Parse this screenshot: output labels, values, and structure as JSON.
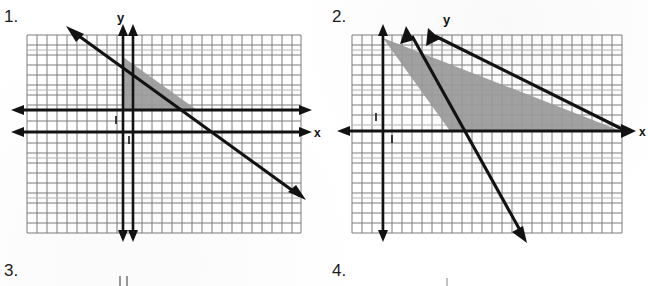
{
  "page": {
    "width": 648,
    "height": 286,
    "background": "#ffffff",
    "ink_color": "#1b1b1b",
    "grid_line_color": "#6f6f6f",
    "grid_line_color_light": "#a9a9a9",
    "shade_color": "#9a9a9a",
    "axis_color": "#111111"
  },
  "problems": [
    {
      "number": "1.",
      "label_x": 4,
      "label_y": 8,
      "graph": {
        "origin_x": 27,
        "origin_y": 35,
        "width": 274,
        "height": 198,
        "cell": 10,
        "cols": 27,
        "rows": 20,
        "axis_labels": {
          "x": "x",
          "y": "y"
        },
        "tick_marks": [
          "1",
          "1"
        ],
        "x_axis_row": 9.7,
        "y_axis_col": 9.5,
        "lines": [
          {
            "name": "boundary-line",
            "x1": 70,
            "y1": 28,
            "x2": 302,
            "y2": 198,
            "arrow_start": true,
            "arrow_end": true
          }
        ],
        "shaded_region": {
          "name": "solution-region",
          "points": "122,56 122,110 196,110"
        }
      }
    },
    {
      "number": "2.",
      "label_x": 332,
      "label_y": 8,
      "graph": {
        "origin_x": 352,
        "origin_y": 35,
        "width": 274,
        "height": 198,
        "cell": 10,
        "cols": 27,
        "rows": 20,
        "axis_labels": {
          "x": "x",
          "y": "y"
        },
        "tick_marks": [
          "1",
          "1"
        ],
        "x_axis_row": 9.7,
        "y_axis_col": 3.0,
        "lines": [
          {
            "name": "steep-boundary-line",
            "x1": 408,
            "y1": 31,
            "x2": 524,
            "y2": 238,
            "arrow_start": true,
            "arrow_end": true
          },
          {
            "name": "shallow-boundary-line",
            "x1": 429,
            "y1": 31,
            "x2": 627,
            "y2": 133,
            "arrow_start": true,
            "arrow_end": true
          }
        ],
        "shaded_region": {
          "name": "solution-region",
          "points": "382,38 622,132 448,132 382,38"
        }
      }
    },
    {
      "number": "3.",
      "label_x": 4,
      "label_y": 262,
      "graph": null
    },
    {
      "number": "4.",
      "label_x": 332,
      "label_y": 262,
      "graph": null
    }
  ]
}
